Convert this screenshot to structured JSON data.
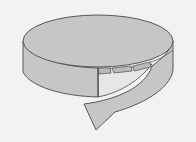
{
  "diagram": {
    "colors": {
      "background": "#f2f2f2",
      "surface": "#c6c6c6",
      "surface_dark": "#b9b9b9",
      "inner": "#e6e6e6",
      "outline": "#4a4a4a"
    },
    "parts": [
      {
        "name": "top-face",
        "shape": "ellipse"
      },
      {
        "name": "lateral-surface",
        "shape": "curved band"
      },
      {
        "name": "unwrapping-strip",
        "shape": "curved band ending in flat edge"
      },
      {
        "name": "tabs",
        "count": 3
      }
    ]
  }
}
